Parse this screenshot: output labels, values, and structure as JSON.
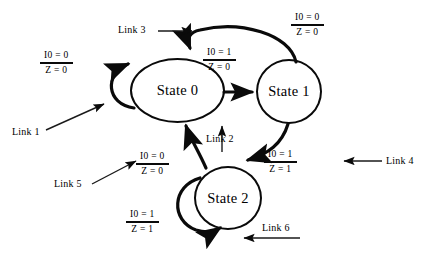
{
  "diagram": {
    "background_color": "#ffffff",
    "ink_color": "#000000",
    "states": [
      {
        "id": "state0",
        "label": "State 0"
      },
      {
        "id": "state1",
        "label": "State 1"
      },
      {
        "id": "state2",
        "label": "State 2"
      }
    ],
    "transition_labels": [
      {
        "id": "cond-state0-selfloop",
        "numerator": "I0 = 0",
        "denominator": "Z = 0"
      },
      {
        "id": "cond-state0-to-state1",
        "numerator": "I0 = 1",
        "denominator": "Z = 0"
      },
      {
        "id": "cond-state1-to-state0",
        "numerator": "I0 = 0",
        "denominator": "Z = 0"
      },
      {
        "id": "cond-state1-to-state2",
        "numerator": "I0 = 1",
        "denominator": "Z = 1"
      },
      {
        "id": "cond-state2-to-state0",
        "numerator": "I0 = 0",
        "denominator": "Z = 0"
      },
      {
        "id": "cond-state2-selfloop",
        "numerator": "I0 = 1",
        "denominator": "Z = 1"
      }
    ],
    "link_callouts": [
      {
        "id": "link1",
        "label": "Link 1",
        "pointer": "arrow-up-right"
      },
      {
        "id": "link2",
        "label": "Link 2",
        "pointer": "arrow-up"
      },
      {
        "id": "link3",
        "label": "Link 3",
        "pointer": "arrow-right"
      },
      {
        "id": "link4",
        "label": "Link 4",
        "pointer": "arrow-left"
      },
      {
        "id": "link5",
        "label": "Link 5",
        "pointer": "arrow-up-right"
      },
      {
        "id": "link6",
        "label": "Link 6",
        "pointer": "arrow-left"
      }
    ]
  }
}
